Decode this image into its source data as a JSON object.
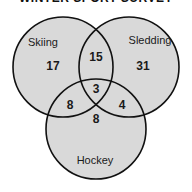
{
  "title": "WINTER SPORT SURVEY",
  "colors": {
    "fill": "#d9d9d9",
    "stroke": "#111111",
    "background": "#ffffff"
  },
  "sets": [
    {
      "id": "skiing",
      "label": "Skiing"
    },
    {
      "id": "sledding",
      "label": "Sledding"
    },
    {
      "id": "hockey",
      "label": "Hockey"
    }
  ],
  "regions": {
    "skiing_only": "17",
    "sledding_only": "31",
    "hockey_only": "8",
    "skiing_sledding": "15",
    "skiing_hockey": "8",
    "sledding_hockey": "4",
    "all_three": "3"
  }
}
